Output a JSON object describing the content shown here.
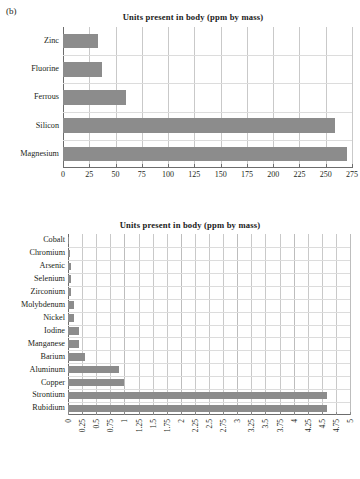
{
  "panel": {
    "label": "(b)"
  },
  "chart_data": [
    {
      "id": "top",
      "type": "bar",
      "orientation": "horizontal",
      "title": "Units present in body (ppm by mass)",
      "xlabel": "",
      "ylabel": "",
      "xlim": [
        0,
        275
      ],
      "xticks": [
        0,
        25,
        50,
        75,
        100,
        125,
        150,
        175,
        200,
        225,
        250,
        275
      ],
      "xtick_labels": [
        "0",
        "25",
        "50",
        "75",
        "100",
        "125",
        "150",
        "175",
        "200",
        "225",
        "250",
        "275"
      ],
      "grid": true,
      "legend": "none",
      "bar_color": "#8c8c8c",
      "categories": [
        "Magnesium",
        "Silicon",
        "Ferrous",
        "Fluorine",
        "Zinc"
      ],
      "values": [
        270,
        259,
        60,
        37,
        33
      ],
      "display_order_top_to_bottom": [
        "Zinc",
        "Fluorine",
        "Ferrous",
        "Silicon",
        "Magnesium"
      ]
    },
    {
      "id": "bottom",
      "type": "bar",
      "orientation": "horizontal",
      "title": "Units present in body (ppm by mass)",
      "xlabel": "",
      "ylabel": "",
      "xlim": [
        0,
        5
      ],
      "xticks": [
        0,
        0.25,
        0.5,
        0.75,
        1,
        1.25,
        1.5,
        1.75,
        2,
        2.25,
        2.5,
        2.75,
        3,
        3.25,
        3.5,
        3.75,
        4,
        4.25,
        4.5,
        4.75,
        5
      ],
      "xtick_labels": [
        "0",
        "0.25",
        "0.5",
        "0.75",
        "1",
        "1.25",
        "1.5",
        "1.75",
        "2",
        "2.25",
        "2.5",
        "2.75",
        "3",
        "3.25",
        "3.5",
        "3.75",
        "4",
        "4.25",
        "4.5",
        "4.75",
        "5"
      ],
      "grid": true,
      "legend": "none",
      "bar_color": "#8c8c8c",
      "categories": [
        "Rubidium",
        "Strontium",
        "Copper",
        "Aluminum",
        "Barium",
        "Manganese",
        "Iodine",
        "Nickel",
        "Molybdenum",
        "Zirconium",
        "Selenium",
        "Arsenic",
        "Chromium",
        "Cobalt"
      ],
      "values": [
        4.6,
        4.6,
        1.0,
        0.9,
        0.3,
        0.2,
        0.2,
        0.1,
        0.1,
        0.05,
        0.05,
        0.05,
        0.03,
        0.02
      ],
      "display_order_top_to_bottom": [
        "Cobalt",
        "Chromium",
        "Arsenic",
        "Selenium",
        "Zirconium",
        "Molybdenum",
        "Nickel",
        "Iodine",
        "Manganese",
        "Barium",
        "Aluminum",
        "Copper",
        "Strontium",
        "Rubidium"
      ]
    }
  ]
}
